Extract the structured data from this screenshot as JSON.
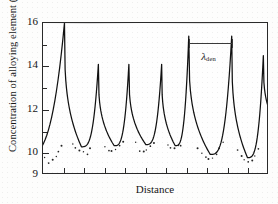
{
  "chart_data": {
    "type": "line",
    "title": "",
    "xlabel": "Distance",
    "ylabel": "Concentration of alloying element (wt-%)",
    "ylim": [
      9,
      16
    ],
    "xlim": [
      0,
      100
    ],
    "grid": false,
    "legend": null,
    "y_tick_labels": [
      "16",
      "14",
      "12",
      "10",
      "9"
    ],
    "y_tick_values": [
      16,
      14,
      12,
      10,
      9
    ],
    "y_minor_tick_values": [
      15,
      13,
      11
    ],
    "x_tick_count": 10,
    "x_tick_labels": [],
    "annotations": [
      {
        "name": "dendrite-arm-spacing",
        "label_lambda": "λ",
        "label_subscript": "den",
        "x_start": 64.5,
        "x_end": 83.5,
        "y": 15.1,
        "note": "measurement bar spanning one dendrite period"
      }
    ],
    "series": [
      {
        "name": "solute profile (fitted curve)",
        "kind": "line",
        "peak_x": [
          9.5,
          24.5,
          38.0,
          52.5,
          64.5,
          83.5,
          97.5
        ],
        "peak_y": [
          16.0,
          14.1,
          14.1,
          14.1,
          15.4,
          15.4,
          14.5
        ],
        "valley_x": [
          17.0,
          31.5,
          45.5,
          58.5,
          74.0,
          90.5
        ],
        "valley_y": [
          10.3,
          10.35,
          10.4,
          10.35,
          9.95,
          9.8
        ],
        "left_edge_y": 9.85
      },
      {
        "name": "measured data points",
        "kind": "scatter",
        "x": [
          1.0,
          2.6,
          4.2,
          5.6,
          7.0,
          8.2,
          13.0,
          14.6,
          16.2,
          17.8,
          19.4,
          21.0,
          27.4,
          29.0,
          30.6,
          32.2,
          33.8,
          35.2,
          41.2,
          42.8,
          44.4,
          46.0,
          47.6,
          49.0,
          55.0,
          56.6,
          58.2,
          59.8,
          61.2,
          68.5,
          70.2,
          71.8,
          73.4,
          75.0,
          76.6,
          78.2,
          79.8,
          86.0,
          87.6,
          89.2,
          90.8,
          92.4,
          94.0,
          95.4
        ],
        "y": [
          9.85,
          9.8,
          9.92,
          10.05,
          10.25,
          10.5,
          10.55,
          10.35,
          10.2,
          10.12,
          10.2,
          10.45,
          10.5,
          10.3,
          10.25,
          10.3,
          10.45,
          10.6,
          10.55,
          10.35,
          10.3,
          10.35,
          10.5,
          10.62,
          10.5,
          10.35,
          10.3,
          10.4,
          10.6,
          10.45,
          10.2,
          10.0,
          9.88,
          9.9,
          10.05,
          10.3,
          10.55,
          10.4,
          10.1,
          9.9,
          9.78,
          9.82,
          10.0,
          10.3
        ]
      }
    ]
  }
}
